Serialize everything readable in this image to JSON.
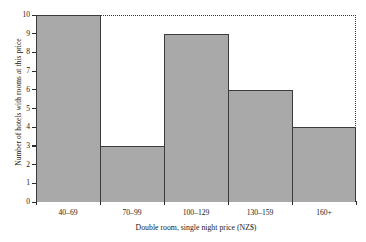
{
  "chart_data": {
    "type": "bar",
    "title": "",
    "subtitle": "",
    "xlabel": "Double room, single night price (NZ$)",
    "ylabel": "Number of hotels with rooms at this price",
    "categories": [
      "40–69",
      "70–99",
      "100–129",
      "130–159",
      "160+"
    ],
    "values": [
      10,
      3,
      9,
      6,
      4
    ],
    "ylim": [
      0,
      10
    ],
    "ytick_labels": [
      "0",
      "1",
      "2",
      "3",
      "4",
      "5",
      "6",
      "7",
      "8",
      "9",
      "10"
    ],
    "ytick_values": [
      0,
      1,
      2,
      3,
      4,
      5,
      6,
      7,
      8,
      9,
      10
    ],
    "grid": false,
    "legend": null,
    "legend_position": "none",
    "bar_fill_color": "#a9a9a9",
    "bar_edge_color": "#3b3b3b",
    "axis_color": "#2b2b2b",
    "frame_top_right_style": "dotted"
  }
}
